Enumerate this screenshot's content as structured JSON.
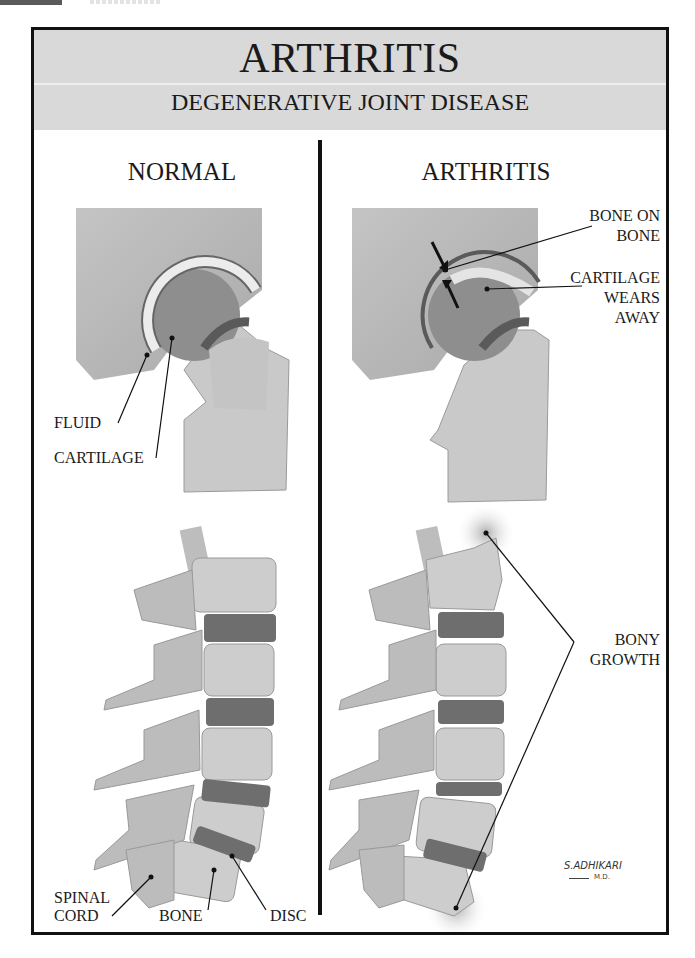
{
  "header": {
    "title": "ARTHRITIS",
    "subtitle": "DEGENERATIVE JOINT DISEASE"
  },
  "columns": [
    {
      "heading": "NORMAL",
      "hip_labels": {
        "fluid": "FLUID",
        "cartilage": "CARTILAGE"
      },
      "spine_labels": {
        "spinal_cord_line1": "SPINAL",
        "spinal_cord_line2": "CORD",
        "bone": "BONE",
        "disc": "DISC"
      }
    },
    {
      "heading": "ARTHRITIS",
      "hip_labels": {
        "bone_on_bone_line1": "BONE ON",
        "bone_on_bone_line2": "BONE",
        "cartilage_wears_line1": "CARTILAGE",
        "cartilage_wears_line2": "WEARS",
        "cartilage_wears_line3": "AWAY"
      },
      "spine_labels": {
        "bony_growth_line1": "BONY",
        "bony_growth_line2": "GROWTH"
      }
    }
  ],
  "signature": {
    "name": "S.ADHIKARI",
    "suffix": "M.D."
  },
  "colors": {
    "header_band": "#d9d9d9",
    "frame": "#111111",
    "bone": "#c8c8c8",
    "disc": "#6e6e6e",
    "cartilage": "#ececec"
  }
}
